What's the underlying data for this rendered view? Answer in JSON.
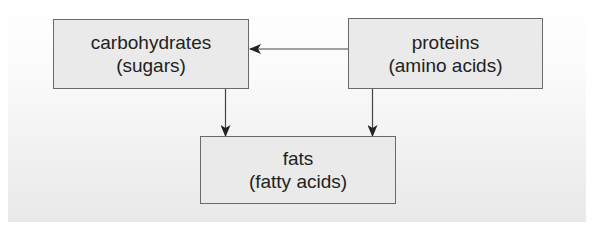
{
  "diagram": {
    "type": "flowchart",
    "nodes": [
      {
        "id": "carbohydrates",
        "title": "carbohydrates",
        "subtitle": "(sugars)"
      },
      {
        "id": "proteins",
        "title": "proteins",
        "subtitle": "(amino acids)"
      },
      {
        "id": "fats",
        "title": "fats",
        "subtitle": "(fatty acids)"
      }
    ],
    "edges": [
      {
        "from": "proteins",
        "to": "carbohydrates"
      },
      {
        "from": "carbohydrates",
        "to": "fats"
      },
      {
        "from": "proteins",
        "to": "fats"
      }
    ],
    "colors": {
      "box_fill": "#eaeaea",
      "box_border": "#6a6a6a",
      "arrow": "#333333",
      "text": "#222222"
    }
  }
}
